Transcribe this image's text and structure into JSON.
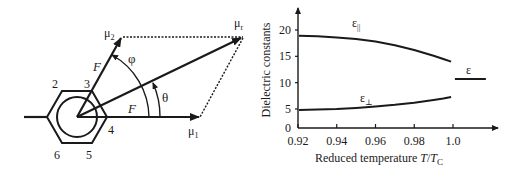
{
  "vector_diagram": {
    "ring_positions": [
      "2",
      "3",
      "4",
      "5",
      "6"
    ],
    "vectors": {
      "mu1": "μ",
      "mu1_sub": "1",
      "mu2": "μ",
      "mu2_sub": "2",
      "mur": "μ",
      "mur_sub": "r"
    },
    "field_labels": [
      "F",
      "F"
    ],
    "angles": {
      "phi": "φ",
      "theta": "θ"
    }
  },
  "chart_data": {
    "type": "line",
    "title": "",
    "xlabel_prefix": "Reduced temperature ",
    "xlabel_T": "T",
    "xlabel_slash": "/",
    "xlabel_Tc": "T",
    "xlabel_Tc_sub": "C",
    "ylabel": "Dielectric constants",
    "xlim": [
      0.92,
      1.02
    ],
    "ylim": [
      0,
      22
    ],
    "xticks": [
      "0.92",
      "0.94",
      "0.96",
      "0.98",
      "1.0"
    ],
    "xtick_values": [
      0.92,
      0.94,
      0.96,
      0.98,
      1.0
    ],
    "yticks": [
      "20",
      "15",
      "10",
      "5",
      "0"
    ],
    "ytick_values": [
      20,
      15,
      10,
      5,
      0
    ],
    "grid": false,
    "series": [
      {
        "name": "ε||",
        "label_main": "ε",
        "label_sub": "||",
        "x": [
          0.9205,
          0.93,
          0.94,
          0.95,
          0.96,
          0.97,
          0.98,
          0.99,
          0.995,
          0.999
        ],
        "y": [
          18.9,
          18.8,
          18.6,
          18.3,
          17.8,
          17.1,
          16.2,
          15.1,
          14.5,
          14.0
        ]
      },
      {
        "name": "ε⊥",
        "label_main": "ε",
        "label_sub": "⊥",
        "x": [
          0.9205,
          0.93,
          0.94,
          0.95,
          0.96,
          0.97,
          0.98,
          0.99,
          0.995,
          0.999
        ],
        "y": [
          4.8,
          4.9,
          5.0,
          5.2,
          5.5,
          5.8,
          6.2,
          6.7,
          7.0,
          7.3
        ]
      },
      {
        "name": "ε",
        "label_main": "ε",
        "label_sub": "",
        "x": [
          1.001,
          1.017
        ],
        "y": [
          10.7,
          10.7
        ]
      }
    ]
  }
}
